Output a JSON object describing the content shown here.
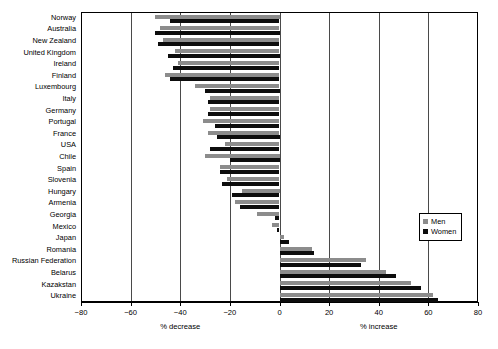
{
  "chart_data": {
    "type": "bar",
    "orientation": "horizontal",
    "title": "",
    "subtitle": "",
    "xlabel_left": "% decrease",
    "xlabel_right": "% increase",
    "ylabel": "",
    "xlim": [
      -80,
      80
    ],
    "xticks": [
      -80,
      -60,
      -40,
      -20,
      0,
      20,
      40,
      60,
      80
    ],
    "xticklabels": [
      "−80",
      "−60",
      "−40",
      "−20",
      "0",
      "20",
      "40",
      "60",
      "80"
    ],
    "grid": true,
    "grid_axis": "x",
    "legend_position": "right",
    "categories": [
      "Norway",
      "Australia",
      "New Zealand",
      "United Kingdom",
      "Ireland",
      "Finland",
      "Luxembourg",
      "Italy",
      "Germany",
      "Portugal",
      "France",
      "USA",
      "Chile",
      "Spain",
      "Slovenia",
      "Hungary",
      "Armenia",
      "Georgia",
      "Mexico",
      "Japan",
      "Romania",
      "Russian Federation",
      "Belarus",
      "Kazakstan",
      "Ukraine"
    ],
    "series": [
      {
        "name": "Men",
        "color": "#8c8c8c",
        "values": [
          -50,
          -48,
          -47,
          -42,
          -41,
          -46,
          -34,
          -28,
          -28,
          -31,
          -29,
          -22,
          -30,
          -24,
          -21,
          -15,
          -18,
          -9,
          -3,
          2,
          13,
          35,
          43,
          53,
          62
        ]
      },
      {
        "name": "Women",
        "color": "#0d0d0d",
        "values": [
          -44,
          -50,
          -49,
          -45,
          -43,
          -44,
          -30,
          -29,
          -29,
          -26,
          -25,
          -28,
          -20,
          -24,
          -23,
          -19,
          -16,
          -2,
          -1,
          4,
          14,
          33,
          47,
          57,
          64
        ]
      }
    ]
  },
  "legend": {
    "items": [
      {
        "label": "Men",
        "color": "#8c8c8c"
      },
      {
        "label": "Women",
        "color": "#0d0d0d"
      }
    ]
  }
}
